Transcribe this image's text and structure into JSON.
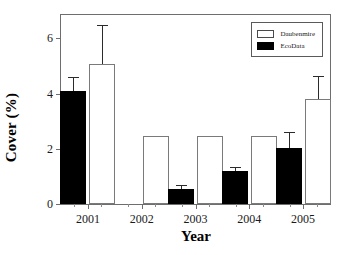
{
  "chart_data": {
    "type": "bar",
    "title": "",
    "xlabel": "Year",
    "ylabel": "Cover (%)",
    "categories": [
      "2001",
      "2002",
      "2003",
      "2004",
      "2005"
    ],
    "ylim": [
      0,
      6.85
    ],
    "yticks": [
      0,
      2,
      4,
      6
    ],
    "ytick_labels": [
      "0",
      "2",
      "4",
      "6"
    ],
    "grid": false,
    "legend_position": "top-right",
    "series": [
      {
        "name": "Daubenmire",
        "style": "open",
        "color": "#ffffff",
        "edge_color": "#7a7a7a",
        "values": [
          5.07,
          2.45,
          2.45,
          2.45,
          3.8
        ],
        "errors": [
          1.43,
          0,
          0,
          0,
          0.85
        ]
      },
      {
        "name": "EcoData",
        "style": "filled",
        "color": "#000000",
        "edge_color": "#000000",
        "values": [
          4.1,
          0,
          0.55,
          1.18,
          2.02
        ],
        "errors": [
          0.52,
          0,
          0.15,
          0.17,
          0.58
        ]
      }
    ]
  },
  "legend": {
    "entries": [
      {
        "label": "Daubenmire",
        "style": "open"
      },
      {
        "label": "EcoData",
        "style": "filled"
      }
    ]
  }
}
